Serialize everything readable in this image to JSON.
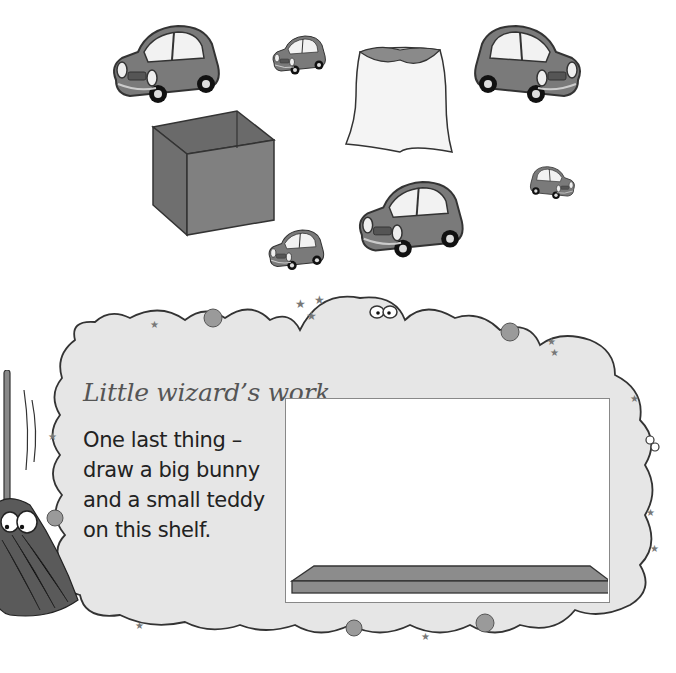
{
  "scene": {
    "objects": [
      {
        "name": "car-large-1",
        "size": "large"
      },
      {
        "name": "car-small-1",
        "size": "small"
      },
      {
        "name": "sack",
        "label": "sack"
      },
      {
        "name": "car-large-2",
        "size": "large"
      },
      {
        "name": "box",
        "label": "box"
      },
      {
        "name": "car-tiny",
        "size": "tiny"
      },
      {
        "name": "car-large-3",
        "size": "large"
      },
      {
        "name": "car-small-2",
        "size": "small"
      }
    ]
  },
  "activity": {
    "title": "Little wizard’s work",
    "instructions": [
      "One last thing –",
      "draw a big bunny",
      "and a small teddy",
      "on this shelf."
    ],
    "drawing_area": {
      "item": "shelf"
    }
  },
  "colors": {
    "car_fill": "#7a7a7a",
    "cloud_fill": "#e6e6e6",
    "outline": "#333333",
    "shelf_fill": "#8c8c8c"
  }
}
